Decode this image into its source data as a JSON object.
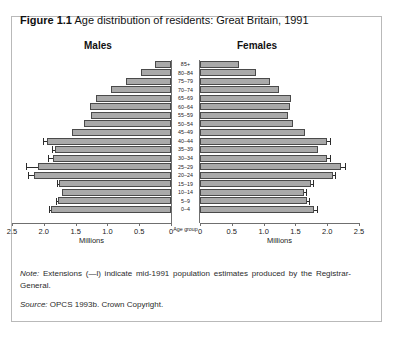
{
  "figure": {
    "label": "Figure 1.1",
    "title": "Age distribution of residents: Great Britain, 1991"
  },
  "headings": {
    "left": "Males",
    "right": "Females"
  },
  "axis": {
    "xlabel_left": "Millions",
    "xlabel_right": "Millions",
    "ylabel": "Age group",
    "ticks_left": [
      "2.5",
      "2.0",
      "1.5",
      "1.0",
      "0.5",
      "0"
    ],
    "ticks_right": [
      "0",
      "0.5",
      "1.0",
      "1.5",
      "2.0",
      "2.5"
    ]
  },
  "notes": {
    "note_prefix": "Note:",
    "note_text": " Extensions (—l) indicate mid-1991 population estimates produced by the Registrar-General.",
    "source_prefix": "Source:",
    "source_text": " OPCS 1993b. Crown Copyright."
  },
  "colors": {
    "bar_fill": "#a9a9a9",
    "bar_stroke": "#4a4a4a",
    "axis": "#6f6f6f",
    "frame": "#b9b9b9",
    "text": "#111111"
  },
  "chart_data": {
    "type": "bar",
    "subtype": "population-pyramid",
    "title": "Figure 1.1 Age distribution of residents: Great Britain, 1991",
    "xlabel": "Millions",
    "ylabel": "Age group",
    "xlim": [
      0,
      2.5
    ],
    "grid": false,
    "legend": "none",
    "categories": [
      "85+",
      "80–84",
      "75–79",
      "70–74",
      "65–69",
      "60–64",
      "55–59",
      "50–54",
      "45–49",
      "40–44",
      "35–39",
      "30–34",
      "25–29",
      "20–24",
      "15–19",
      "10–14",
      "5–9",
      "0–4"
    ],
    "series": [
      {
        "name": "Males",
        "direction": "left",
        "values": [
          0.25,
          0.47,
          0.71,
          0.95,
          1.18,
          1.27,
          1.26,
          1.37,
          1.56,
          1.95,
          1.82,
          1.85,
          2.09,
          2.15,
          1.76,
          1.72,
          1.78,
          1.88
        ]
      },
      {
        "name": "Females",
        "direction": "right",
        "values": [
          0.62,
          0.88,
          1.1,
          1.24,
          1.43,
          1.41,
          1.38,
          1.47,
          1.65,
          2.0,
          1.85,
          2.0,
          2.22,
          2.09,
          1.74,
          1.63,
          1.68,
          1.79
        ]
      }
    ],
    "extensions": {
      "description": "Mid-1991 population estimates produced by the Registrar-General",
      "males": [
        {
          "category": "40–44",
          "value": 2.02
        },
        {
          "category": "35–39",
          "value": 1.87
        },
        {
          "category": "30–34",
          "value": 1.94
        },
        {
          "category": "25–29",
          "value": 2.28
        },
        {
          "category": "20–24",
          "value": 2.25
        },
        {
          "category": "15–19",
          "value": 1.8
        },
        {
          "category": "5–9",
          "value": 1.81
        },
        {
          "category": "0–4",
          "value": 1.92
        }
      ],
      "females": [
        {
          "category": "40–44",
          "value": 2.04
        },
        {
          "category": "30–34",
          "value": 2.04
        },
        {
          "category": "25–29",
          "value": 2.28
        },
        {
          "category": "20–24",
          "value": 2.13
        },
        {
          "category": "15–19",
          "value": 1.78
        },
        {
          "category": "10–14",
          "value": 1.66
        },
        {
          "category": "5–9",
          "value": 1.71
        },
        {
          "category": "0–4",
          "value": 1.84
        }
      ]
    }
  }
}
